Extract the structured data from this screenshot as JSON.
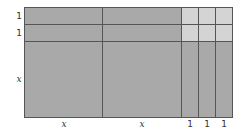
{
  "diagram": {
    "type": "algebra-tiles-area-model",
    "expression_rows": [
      "1",
      "1",
      "x"
    ],
    "expression_cols": [
      "x",
      "x",
      "1",
      "1",
      "1"
    ],
    "colors": {
      "x_squared_and_x_tiles": "#a9a9a9",
      "unit_tiles": "#d4d4d4",
      "lines": "#555555"
    },
    "left_labels": [
      {
        "text": "1"
      },
      {
        "text": "1"
      },
      {
        "text": "x"
      }
    ],
    "bottom_labels": [
      {
        "text": "x"
      },
      {
        "text": "x"
      },
      {
        "text": "1"
      },
      {
        "text": "1"
      },
      {
        "text": "1"
      }
    ]
  }
}
